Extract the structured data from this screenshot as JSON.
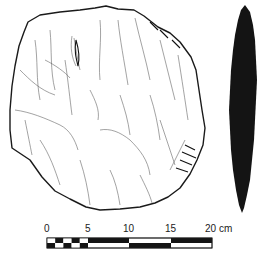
{
  "figure": {
    "views": [
      "face-view",
      "side-profile-view"
    ],
    "colors": {
      "line": "#1a1a1a",
      "profile_fill": "#141414",
      "background": "#ffffff"
    }
  },
  "scale_bar": {
    "unit": "cm",
    "labels": [
      "0",
      "5",
      "10",
      "15",
      "20 cm"
    ],
    "ticks_cm": [
      0,
      5,
      10,
      15,
      20
    ],
    "minor_subdivisions_first_segment": 5
  }
}
